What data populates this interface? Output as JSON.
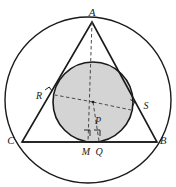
{
  "figure": {
    "background_color": "#ffffff",
    "stroke_color": "#1a1a1a",
    "incircle_fill": "#d4d4d4",
    "dash_color": "#4a4a4a"
  },
  "circumcircle": {
    "name": "circumcircle",
    "cx": 88,
    "cy": 100,
    "r": 83,
    "fill": "none",
    "stroke_width": 1.4
  },
  "incircle": {
    "name": "incircle",
    "cx": 93,
    "cy": 102,
    "r": 40,
    "fill": "#d4d4d4",
    "stroke_width": 1.6
  },
  "triangle": {
    "name": "triangle-ABC",
    "points": "92,22 157,142 22,142",
    "stroke_width": 1.6
  },
  "base_line": {
    "name": "segment-CB",
    "x1": 22,
    "y1": 142,
    "x2": 157,
    "y2": 142
  },
  "dashed_segments": [
    {
      "name": "altitude-A-to-M",
      "x1": 92,
      "y1": 22,
      "x2": 88,
      "y2": 142
    },
    {
      "name": "radius-P-to-R",
      "x1": 93,
      "y1": 102,
      "x2": 55,
      "y2": 95
    },
    {
      "name": "radius-P-to-S",
      "x1": 93,
      "y1": 102,
      "x2": 131,
      "y2": 110
    },
    {
      "name": "radius-P-to-Q",
      "x1": 93,
      "y1": 102,
      "x2": 99,
      "y2": 141
    }
  ],
  "right_angle_marks": [
    {
      "name": "right-angle-at-M",
      "x": 84,
      "y": 136,
      "size": 6,
      "rotate": 0
    },
    {
      "name": "right-angle-at-Q",
      "x": 94,
      "y": 136,
      "size": 6,
      "rotate": 0
    },
    {
      "name": "right-angle-at-R",
      "x": 48,
      "y": 94,
      "size": 5,
      "rotate": -35
    },
    {
      "name": "right-angle-at-S",
      "x": 128,
      "y": 104,
      "size": 5,
      "rotate": 28
    }
  ],
  "labels": [
    {
      "name": "label-A",
      "text": "A",
      "x": 92,
      "y": 16,
      "anchor": "middle",
      "class": "vertex-label"
    },
    {
      "name": "label-B",
      "text": "B",
      "x": 163,
      "y": 144,
      "anchor": "middle",
      "class": "vertex-label"
    },
    {
      "name": "label-C",
      "text": "C",
      "x": 11,
      "y": 144,
      "anchor": "middle",
      "class": "vertex-label"
    },
    {
      "name": "label-R",
      "text": "R",
      "x": 39,
      "y": 99,
      "anchor": "middle",
      "class": "point-label"
    },
    {
      "name": "label-S",
      "text": "S",
      "x": 146,
      "y": 109,
      "anchor": "middle",
      "class": "point-label"
    },
    {
      "name": "label-P",
      "text": "P",
      "x": 98,
      "y": 124,
      "anchor": "middle",
      "class": "point-label"
    },
    {
      "name": "label-M",
      "text": "M",
      "x": 86,
      "y": 155,
      "anchor": "middle",
      "class": "point-label"
    },
    {
      "name": "label-Q",
      "text": "Q",
      "x": 99,
      "y": 155,
      "anchor": "middle",
      "class": "point-label"
    }
  ],
  "point_markers": [
    {
      "name": "point-P-dot",
      "cx": 93,
      "cy": 102,
      "r": 1.3
    }
  ]
}
